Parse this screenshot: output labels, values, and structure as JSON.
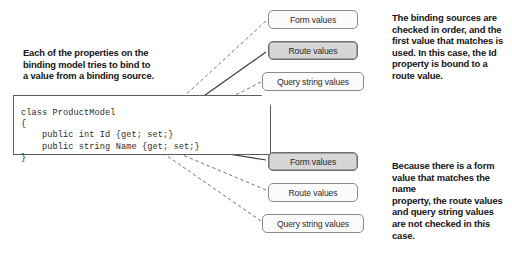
{
  "diagram": {
    "notes": {
      "left": "Each of the properties on the\nbinding model tries to bind to\na value from a binding source.",
      "top_right": "The binding sources are\nchecked in order, and the\nfirst value that matches is\nused. In this case, the Id\nproperty is bound to a\nroute value.",
      "bottom_right": "Because there is a form\nvalue that matches the name\nproperty, the route values\nand query string values\nare not checked in this case."
    },
    "code": {
      "language": "csharp",
      "text": "class ProductModel\n{\n    public int Id {get; set;}\n    public string Name {get; set;}\n}",
      "lines": [
        "class ProductModel",
        "{",
        "    public int Id {get; set;}",
        "    public string Name {get; set;}",
        "}"
      ]
    },
    "binding_groups": [
      {
        "target_property": "Id",
        "sources": [
          {
            "label": "Form values",
            "matched": false,
            "arrow": "dashed"
          },
          {
            "label": "Route values",
            "matched": true,
            "arrow": "solid"
          },
          {
            "label": "Query string values",
            "matched": false,
            "arrow": "dashed"
          }
        ]
      },
      {
        "target_property": "Name",
        "sources": [
          {
            "label": "Form values",
            "matched": true,
            "arrow": "solid"
          },
          {
            "label": "Route values",
            "matched": false,
            "arrow": "dashed"
          },
          {
            "label": "Query string values",
            "matched": false,
            "arrow": "dashed"
          }
        ]
      }
    ],
    "colors": {
      "background": "#ffffff",
      "text": "#141414",
      "code_text": "#2b2b2b",
      "box_border": "#8a8a8a",
      "box_fill": "#fbfbfb",
      "box_fill_matched": "#d6d6d6",
      "arrow": "#4a4a4a",
      "code_border": "#5c5c5c"
    }
  }
}
